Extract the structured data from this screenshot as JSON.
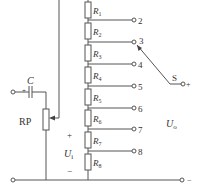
{
  "diagram": {
    "type": "circuit-schematic",
    "colors": {
      "wire": "#555555",
      "text": "#333333",
      "background": "#ffffff"
    },
    "input": {
      "capacitor_label": "C",
      "capacitor_polarity": "+",
      "potentiometer_label": "RP",
      "ui_plus": "+",
      "ui_label": "U",
      "ui_sub": "i",
      "ui_minus": "−"
    },
    "resistors": [
      {
        "name": "R",
        "sub": "1"
      },
      {
        "name": "R",
        "sub": "2"
      },
      {
        "name": "R",
        "sub": "3"
      },
      {
        "name": "R",
        "sub": "4"
      },
      {
        "name": "R",
        "sub": "5"
      },
      {
        "name": "R",
        "sub": "6"
      },
      {
        "name": "R",
        "sub": "7"
      },
      {
        "name": "R",
        "sub": "8"
      }
    ],
    "taps": [
      "2",
      "3",
      "4",
      "5",
      "6",
      "7",
      "8"
    ],
    "switch": {
      "label": "S",
      "selected_tap": "3",
      "out_plus": "+"
    },
    "output": {
      "label": "U",
      "sub": "o",
      "minus": "−"
    }
  }
}
